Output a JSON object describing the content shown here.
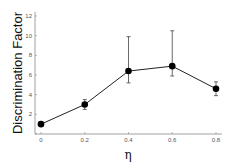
{
  "chart_data": {
    "type": "line",
    "title": "",
    "xlabel": "η",
    "ylabel": "Discrimination Factor",
    "x": [
      0,
      0.2,
      0.4,
      0.6,
      0.8
    ],
    "x_tick_labels": [
      "0",
      "0.2",
      "0.4",
      "0.6",
      "0.8"
    ],
    "y_tick_labels": [
      "0",
      "2",
      "4",
      "6",
      "8",
      "10",
      "12"
    ],
    "ylim": [
      0,
      12
    ],
    "xlim": [
      0,
      0.8
    ],
    "grid": false,
    "legend": null,
    "series": [
      {
        "name": "Discrimination Factor",
        "values": [
          1.0,
          3.0,
          6.4,
          6.9,
          4.6
        ],
        "error_low": [
          1.0,
          2.5,
          5.2,
          5.9,
          3.9
        ],
        "error_high": [
          1.0,
          3.5,
          9.9,
          10.5,
          5.3
        ],
        "marker": "filled-circle",
        "color": "#000000"
      }
    ]
  }
}
